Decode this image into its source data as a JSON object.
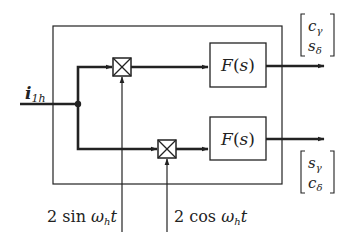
{
  "diagram": {
    "input_label": {
      "main": "i",
      "sub": "1h"
    },
    "blocks": {
      "filter_top": "F(s)",
      "filter_bottom": "F(s)"
    },
    "multipliers": [
      "multiplier-sin",
      "multiplier-cos"
    ],
    "reference_signals": {
      "sin": {
        "coef": "2 sin ",
        "omega": "ω",
        "sub": "h",
        "t": "t"
      },
      "cos": {
        "coef": "2 cos ",
        "omega": "ω",
        "sub": "h",
        "t": "t"
      }
    },
    "outputs": {
      "top": {
        "row1": {
          "base": "c",
          "sub": "γ"
        },
        "row2": {
          "base": "s",
          "sub": "δ"
        }
      },
      "bottom": {
        "row1": {
          "base": "s",
          "sub": "γ"
        },
        "row2": {
          "base": "c",
          "sub": "δ"
        }
      }
    },
    "colors": {
      "line": "#222222",
      "background": "#ffffff"
    }
  }
}
